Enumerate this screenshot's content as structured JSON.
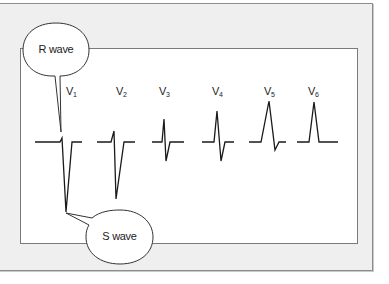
{
  "diagram": {
    "type": "ecg-precordial-leads",
    "leads": [
      {
        "name": "V",
        "subscript": "1"
      },
      {
        "name": "V",
        "subscript": "2"
      },
      {
        "name": "V",
        "subscript": "3"
      },
      {
        "name": "V",
        "subscript": "4"
      },
      {
        "name": "V",
        "subscript": "5"
      },
      {
        "name": "V",
        "subscript": "6"
      }
    ],
    "callouts": {
      "r_wave": "R wave",
      "s_wave": "S wave"
    },
    "colors": {
      "frame_background": "#efefef",
      "frame_border": "#8c8c8c",
      "panel_background": "#ffffff",
      "waveform_stroke": "#1a1a1a"
    }
  }
}
